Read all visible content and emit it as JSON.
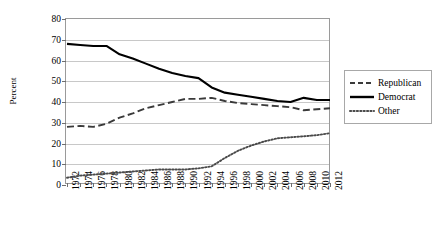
{
  "chart_data": {
    "type": "line",
    "title": "",
    "xlabel": "",
    "ylabel": "Percent",
    "ylim": [
      0,
      80
    ],
    "ytick_step": 10,
    "yticks": [
      0,
      10,
      20,
      30,
      40,
      50,
      60,
      70,
      80
    ],
    "grid": true,
    "legend_position": "right",
    "categories": [
      "1972",
      "1974",
      "1976",
      "1978",
      "1980",
      "1982",
      "1984",
      "1986",
      "1988",
      "1990",
      "1992",
      "1994",
      "1996",
      "1998",
      "2000",
      "2002",
      "2004",
      "2006",
      "2008",
      "2010",
      "2012"
    ],
    "series": [
      {
        "name": "Republican",
        "style": "dashed",
        "color": "#3a3a3a",
        "values": [
          28,
          28.5,
          28,
          29.5,
          32.5,
          34.5,
          37,
          38.5,
          40,
          41.5,
          41.5,
          42,
          40.5,
          39.5,
          39,
          38.5,
          38,
          37.5,
          36,
          36.5,
          37
        ]
      },
      {
        "name": "Democrat",
        "style": "solid",
        "color": "#000000",
        "values": [
          68,
          67.5,
          67,
          67,
          63,
          61,
          58.5,
          56,
          54,
          52.5,
          51.5,
          47,
          44.5,
          43.5,
          42.5,
          41.5,
          40.5,
          40,
          42,
          41,
          41
        ]
      },
      {
        "name": "Other",
        "style": "dotted",
        "color": "#4a4a4a",
        "values": [
          3.5,
          4.5,
          5,
          5.5,
          6,
          6.5,
          7,
          7.5,
          7.5,
          7.5,
          8,
          9,
          13,
          16.5,
          19,
          21,
          22.5,
          23,
          23.5,
          24,
          25
        ]
      }
    ]
  },
  "legend": {
    "items": [
      {
        "label": "Republican"
      },
      {
        "label": "Democrat"
      },
      {
        "label": "Other"
      }
    ]
  }
}
